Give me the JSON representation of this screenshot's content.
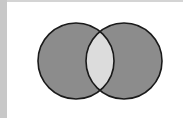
{
  "diagram": {
    "type": "venn",
    "operation": "symmetric-difference",
    "sets": [
      {
        "name": "A",
        "cx": 76,
        "cy": 61,
        "r": 38
      },
      {
        "name": "B",
        "cx": 124,
        "cy": 61,
        "r": 38
      }
    ],
    "colors": {
      "set_fill": "#8c8c8c",
      "intersection_fill": "#dcdcdc",
      "stroke": "#1a1a1a",
      "background": "#ffffff",
      "frame": "#c8c8c8"
    }
  }
}
